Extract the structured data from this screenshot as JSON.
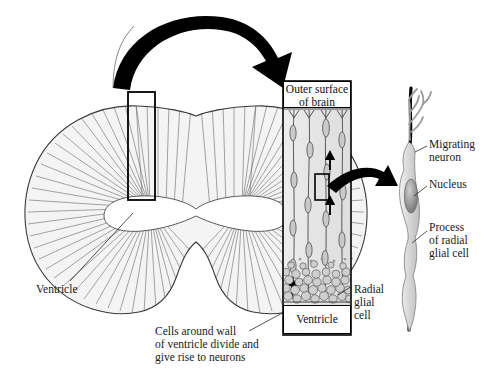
{
  "figure": {
    "background_color": "#ffffff",
    "ink_color": "#000000",
    "fill_gray": "#e8e8e8"
  },
  "panels": {
    "brain_section": {
      "name": "Coronal brain section with radial organization",
      "ventricle_label": "Ventricle",
      "callout_box": "magnified region"
    },
    "column": {
      "name": "Magnified cortical wall column",
      "top_label": "Outer surface\nof brain",
      "bottom_label": "Ventricle",
      "radial_glial_label": "Radial\nglial\ncell",
      "caption": "Cells around wall\nof ventricle divide and\ngive rise to neurons"
    },
    "neuron_detail": {
      "name": "Migrating neuron on radial glial process",
      "migrating_neuron_label": "Migrating\nneuron",
      "nucleus_label": "Nucleus",
      "process_label": "Process\nof radial\nglial cell"
    }
  },
  "arrows": {
    "brain_to_column": "curved-arrow",
    "column_to_neuron": "curved-arrow",
    "migration_direction": "upward-arrow"
  }
}
